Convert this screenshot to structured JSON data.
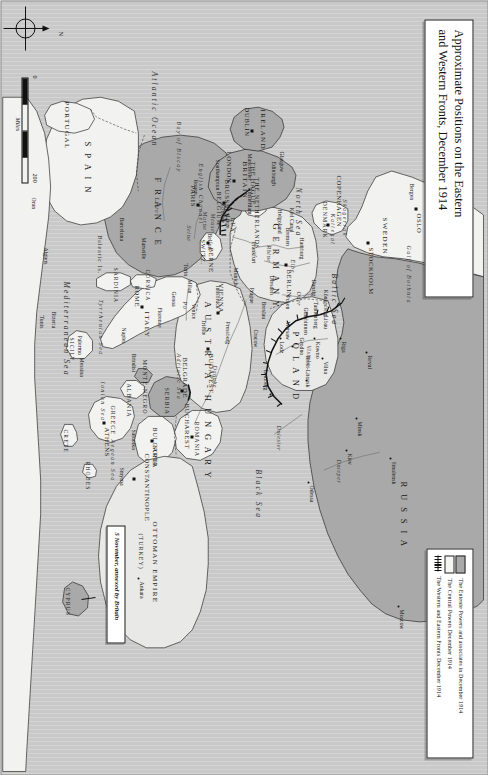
{
  "title": {
    "line1": "Approximate Positions on the Eastern",
    "line2": "and Western Fronts, December 1914"
  },
  "legend": {
    "items": [
      {
        "key": "entente",
        "label": "The Entente Powers and associates in December 1914"
      },
      {
        "key": "central",
        "label": "The Central Powers December 1914"
      },
      {
        "key": "fronts",
        "label": "The Western and Eastern Fronts December 1914"
      }
    ]
  },
  "scale": {
    "min": "0",
    "max": "200",
    "unit": "Miles"
  },
  "compass": {
    "north": "N"
  },
  "callout": {
    "text": "5 November, annexed by Britain"
  },
  "countries": [
    {
      "name": "RUSSIA",
      "side": "entente"
    },
    {
      "name": "POLAND",
      "side": "central"
    },
    {
      "name": "GERMANY",
      "side": "central"
    },
    {
      "name": "AUSTRIA-HUNGARY",
      "side": "central"
    },
    {
      "name": "FRANCE",
      "side": "entente"
    },
    {
      "name": "BRITAIN",
      "side": "entente"
    },
    {
      "name": "IRELAND",
      "side": "entente"
    },
    {
      "name": "BELGIUM",
      "side": "entente"
    },
    {
      "name": "SERBIA",
      "side": "entente"
    },
    {
      "name": "MONTE-NEGRO",
      "side": "entente"
    },
    {
      "name": "ROMANIA",
      "side": "neutral"
    },
    {
      "name": "BULGARIA",
      "side": "neutral"
    },
    {
      "name": "GREECE",
      "side": "neutral"
    },
    {
      "name": "ALBANIA",
      "side": "neutral"
    },
    {
      "name": "ITALY",
      "side": "neutral"
    },
    {
      "name": "SPAIN",
      "side": "neutral"
    },
    {
      "name": "PORTUGAL",
      "side": "neutral"
    },
    {
      "name": "SWITZ.",
      "side": "neutral"
    },
    {
      "name": "NORWAY",
      "side": "neutral"
    },
    {
      "name": "SWEDEN",
      "side": "neutral"
    },
    {
      "name": "DENMARK",
      "side": "neutral"
    },
    {
      "name": "NETHERLANDS",
      "side": "neutral"
    },
    {
      "name": "LUX.",
      "side": "neutral"
    },
    {
      "name": "OTTOMAN EMPIRE",
      "side": "central"
    }
  ],
  "labels": {
    "countries": {
      "russia": "R U S S I A",
      "poland": "P O L A N D",
      "germany": "G E R M A N Y",
      "austria_hungary": "A U S T R I A - H U N G A R Y",
      "france": "F R A N C E",
      "britain": "BRITAIN",
      "ireland": "IRELAND",
      "belgium": "BELGIUM",
      "netherlands": "THE NETHERLANDS",
      "lux": "LUX.",
      "switz": "SWITZ.",
      "italy": "ITALY",
      "spain": "S P A I N",
      "portugal": "PORTUGAL",
      "norway": "NORWAY",
      "sweden": "SWEDEN",
      "denmark": "DENMARK",
      "serbia": "SERBIA",
      "montenegro": "MONTE-NEGRO",
      "albania": "ALBANIA",
      "romania": "ROMANIA",
      "bulgaria": "BULGARIA",
      "greece": "GREECE",
      "ottoman": "OTTOMAN EMPIRE",
      "turkey": "(TURKEY)"
    },
    "capitals": [
      {
        "name": "ST PETERSBURG"
      },
      {
        "name": "STOCKHOLM"
      },
      {
        "name": "OSLO"
      },
      {
        "name": "COPENHAGEN"
      },
      {
        "name": "BERLIN"
      },
      {
        "name": "LONDON"
      },
      {
        "name": "DUBLIN"
      },
      {
        "name": "PARIS"
      },
      {
        "name": "BRUSSELS"
      },
      {
        "name": "THE HAGUE"
      },
      {
        "name": "BERNE"
      },
      {
        "name": "ROME"
      },
      {
        "name": "VIENNA"
      },
      {
        "name": "BUDAPEST"
      },
      {
        "name": "BELGRADE"
      },
      {
        "name": "BUCHAREST"
      },
      {
        "name": "SOFIA"
      },
      {
        "name": "ATHENS"
      },
      {
        "name": "CONSTANTINOPLE"
      },
      {
        "name": "Moscow"
      },
      {
        "name": "Ankara"
      }
    ],
    "cities": [
      "Reval",
      "Riga",
      "Libau",
      "Kowno",
      "Vilna",
      "Gumbinnen",
      "Minsk",
      "Smolensk",
      "Kiev",
      "Odessa",
      "Warsaw",
      "Lodz",
      "Brest-Litovsk",
      "Grodno",
      "Lemberg",
      "Tannenberg",
      "Königsberg",
      "Danzig",
      "Posen",
      "Breslau",
      "Cracow",
      "Prague",
      "Pressburg",
      "Dresden",
      "Munich",
      "Innsbruck",
      "Trieste",
      "Venice",
      "Milan",
      "Turin",
      "Genoa",
      "Florence",
      "Naples",
      "Brindisi",
      "Palermo",
      "Messina",
      "Hamburg",
      "Bremen",
      "Frankfurt",
      "Liege",
      "Rouen",
      "Belfort",
      "Marseille",
      "Barcelona",
      "Algiers",
      "Oran",
      "Bizerta",
      "Tunis",
      "Salonika",
      "Smyrna",
      "Glasgow",
      "Edinburgh",
      "Manchester",
      "Southampton",
      "Amsterdam",
      "Helgoland",
      "Kiel Canal",
      "Bergen"
    ],
    "seas": [
      "Atlantic Ocean",
      "North Sea",
      "Baltic Sea",
      "Black Sea",
      "Mediterranean Sea",
      "Adriatic Sea",
      "Tyrrhenian Sea",
      "Ionian Sea",
      "Aegean Sea",
      "English Channel",
      "Bay of Biscay",
      "Skagerrak",
      "Kattegat",
      "Gulf of Bothnia"
    ],
    "islands": [
      "CORSICA",
      "SARDINIA",
      "SICILY",
      "CRETE",
      "RHODES",
      "CYPRUS",
      "Balearic Is."
    ],
    "rivers": [
      "Rhine",
      "Danube",
      "Loire",
      "Seine",
      "Meuse",
      "Elbe",
      "Oder",
      "Vistula",
      "Dnieper",
      "Dniester",
      "Po",
      "Somme",
      "Marne"
    ]
  },
  "colors": {
    "entente_fill": "#a9a9a9",
    "central_fill": "#e9e9e7",
    "neutral_fill": "#f2f2f0",
    "sea_fill": "#c9c9c9",
    "front_line": "#111111",
    "paper": "#ffffff"
  }
}
